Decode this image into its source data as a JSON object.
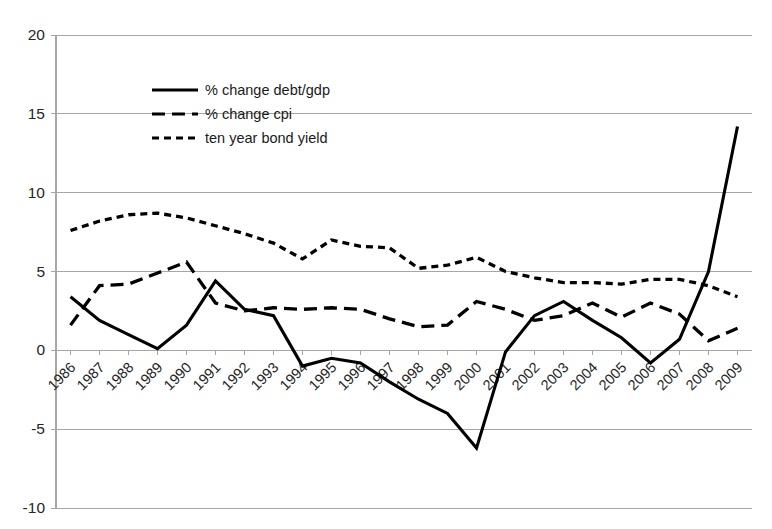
{
  "chart_data": {
    "type": "line",
    "title": "",
    "subtitle": "",
    "xlabel": "",
    "ylabel": "",
    "grid": true,
    "legend_position": "upper-left-inside",
    "ylim": [
      -10,
      20
    ],
    "yticks": [
      20,
      15,
      10,
      5,
      0,
      -5,
      -10
    ],
    "categories": [
      "1986",
      "1987",
      "1988",
      "1989",
      "1990",
      "1991",
      "1992",
      "1993",
      "1994",
      "1995",
      "1996",
      "1997",
      "1998",
      "1999",
      "2000",
      "2001",
      "2002",
      "2003",
      "2004",
      "2005",
      "2006",
      "2007",
      "2008",
      "2009"
    ],
    "series": [
      {
        "name": "% change debt/gdp",
        "style": "solid",
        "values": [
          3.4,
          1.9,
          1.0,
          0.1,
          1.6,
          4.4,
          2.6,
          2.2,
          -1.0,
          -0.5,
          -0.8,
          -2.0,
          -3.1,
          -4.0,
          -6.2,
          -0.1,
          2.2,
          3.1,
          1.9,
          0.8,
          -0.8,
          0.7,
          5.0,
          14.2
        ]
      },
      {
        "name": "% change cpi",
        "style": "long-dash",
        "values": [
          1.6,
          4.1,
          4.2,
          4.9,
          5.6,
          3.0,
          2.5,
          2.7,
          2.6,
          2.7,
          2.6,
          2.0,
          1.5,
          1.6,
          3.1,
          2.6,
          1.9,
          2.2,
          3.0,
          2.1,
          3.0,
          2.3,
          0.6,
          1.4
        ]
      },
      {
        "name": "ten year bond yield",
        "style": "short-dash",
        "values": [
          7.6,
          8.2,
          8.6,
          8.7,
          8.4,
          7.9,
          7.4,
          6.8,
          5.8,
          7.0,
          6.6,
          6.5,
          5.2,
          5.4,
          5.9,
          5.0,
          4.6,
          4.3,
          4.3,
          4.2,
          4.5,
          4.5,
          4.1,
          3.4
        ]
      }
    ],
    "legend": [
      {
        "label": "% change debt/gdp",
        "style": "solid"
      },
      {
        "label": "% change cpi",
        "style": "long-dash"
      },
      {
        "label": "ten year bond yield",
        "style": "short-dash"
      }
    ],
    "colors": {
      "series": "#000000",
      "grid": "#a6a6a6",
      "text": "#262626",
      "background": "#ffffff"
    },
    "geometry": {
      "plot_left": 56,
      "plot_right": 752,
      "plot_top": 35,
      "plot_bottom": 508,
      "legend_x": 152,
      "legend_y_start": 90,
      "legend_row_step": 24,
      "legend_swatch_len": 46
    }
  }
}
